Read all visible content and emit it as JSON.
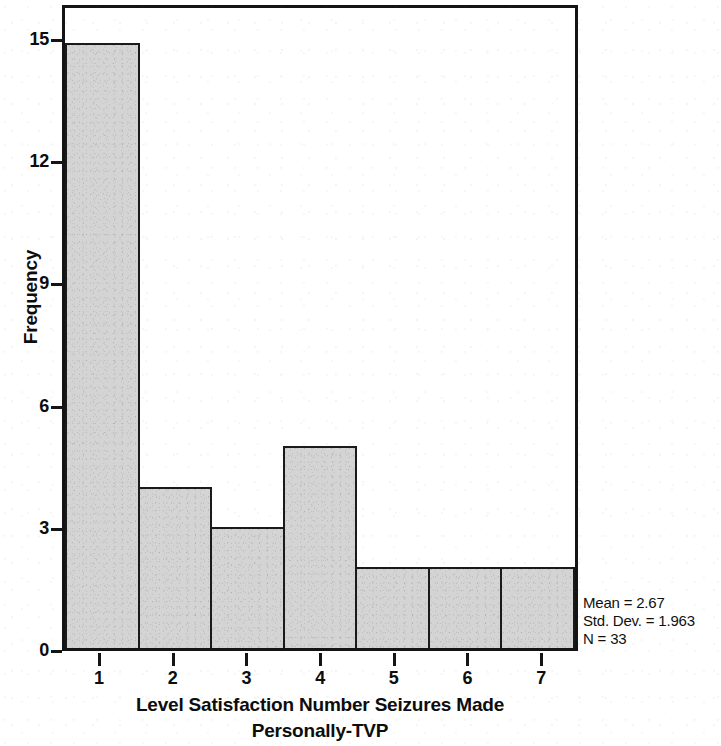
{
  "chart_data": {
    "type": "bar",
    "title": "",
    "subtitle": "",
    "xlabel": "Level Satisfaction Number Seizures Made Personally-TVP",
    "xlabel_line1": "Level Satisfaction Number Seizures Made",
    "xlabel_line2": "Personally-TVP",
    "ylabel": "Frequency",
    "categories": [
      "1",
      "2",
      "3",
      "4",
      "5",
      "6",
      "7"
    ],
    "values": [
      15,
      4,
      3,
      5,
      2,
      2,
      2
    ],
    "xlim": [
      0.5,
      7.5
    ],
    "ylim": [
      0,
      15
    ],
    "x_ticks": [
      "1",
      "2",
      "3",
      "4",
      "5",
      "6",
      "7"
    ],
    "y_ticks": [
      "0",
      "3",
      "6",
      "9",
      "12",
      "15"
    ],
    "y_tick_values": [
      0,
      3,
      6,
      9,
      12,
      15
    ],
    "grid": false,
    "legend": false,
    "bar_fill_color": "#d4d4d4",
    "bar_border_color": "#1a1a1a",
    "axis_color": "#141414",
    "text_color": "#0d0d0d",
    "background_color": "#ffffff"
  },
  "annotations": {
    "mean_label": "Mean = 2.67",
    "std_dev_label": "Std. Dev. = 1.963",
    "n_label": "N = 33",
    "mean_value": 2.67,
    "std_dev_value": 1.963,
    "n_value": 33
  }
}
